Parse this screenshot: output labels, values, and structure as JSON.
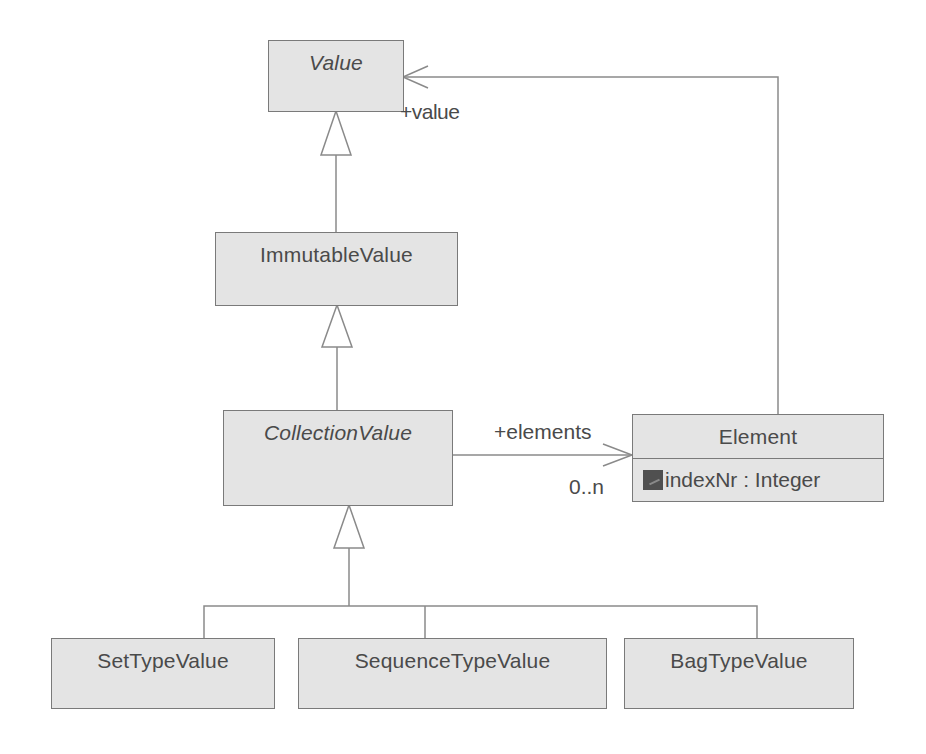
{
  "diagram": {
    "type": "UML class diagram",
    "classes": {
      "value": {
        "name": "Value",
        "abstract": true
      },
      "immutable_value": {
        "name": "ImmutableValue",
        "abstract": false
      },
      "collection_value": {
        "name": "CollectionValue",
        "abstract": true
      },
      "element": {
        "name": "Element",
        "attributes": [
          {
            "icon": "private-attribute-icon",
            "text": "indexNr : Integer"
          }
        ]
      },
      "set_type_value": {
        "name": "SetTypeValue",
        "abstract": false
      },
      "sequence_type_value": {
        "name": "SequenceTypeValue",
        "abstract": false
      },
      "bag_type_value": {
        "name": "BagTypeValue",
        "abstract": false
      }
    },
    "relations": {
      "generalizations": [
        {
          "child": "ImmutableValue",
          "parent": "Value"
        },
        {
          "child": "CollectionValue",
          "parent": "ImmutableValue"
        },
        {
          "child": "SetTypeValue",
          "parent": "CollectionValue"
        },
        {
          "child": "SequenceTypeValue",
          "parent": "CollectionValue"
        },
        {
          "child": "BagTypeValue",
          "parent": "CollectionValue"
        }
      ],
      "associations": [
        {
          "from": "CollectionValue",
          "to": "Element",
          "role": "+elements",
          "multiplicity": "0..n"
        },
        {
          "from": "Element",
          "to": "Value",
          "role": "+value"
        }
      ]
    },
    "labels": {
      "elements_role": "+elements",
      "elements_multiplicity": "0..n",
      "value_role": "+value"
    },
    "colors": {
      "box_fill": "#e4e4e4",
      "box_border": "#7a7a7a",
      "text": "#4a4a4a",
      "line": "#8a8a8a"
    }
  }
}
